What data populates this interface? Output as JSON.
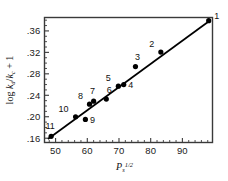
{
  "chart_data": {
    "type": "scatter",
    "title": "",
    "subtitle": "",
    "xlabel": "P_s^{1/2}",
    "xlabel_base": "P",
    "xlabel_sub": "s",
    "xlabel_sup": "1/2",
    "ylabel": "log k_d/k_c + 1",
    "ylabel_parts": [
      "log ",
      "k",
      "d",
      "/",
      "k",
      "c",
      " + 1"
    ],
    "xlim": [
      46.5,
      99.5
    ],
    "ylim": [
      0.152,
      0.385
    ],
    "xticks": [
      50,
      60,
      70,
      80,
      90
    ],
    "xtick_labels": [
      "50",
      "60",
      "70",
      "80",
      "90"
    ],
    "xminor_step": 2,
    "yticks": [
      0.16,
      0.2,
      0.24,
      0.28,
      0.32,
      0.36
    ],
    "ytick_labels": [
      ".16",
      ".20",
      ".24",
      ".28",
      ".32",
      ".36"
    ],
    "yminor_step": 0.01,
    "grid": false,
    "legend": "none",
    "marker": "filled-circle",
    "marker_color": "#000000",
    "line_color": "#000000",
    "fit_line": {
      "x1": 47.6,
      "y1": 0.1585,
      "x2": 98.6,
      "y2": 0.379
    },
    "points": [
      {
        "label": "1",
        "x": 98.3,
        "y": 0.379,
        "label_dx": 8,
        "label_dy": -2
      },
      {
        "label": "2",
        "x": 83.2,
        "y": 0.3205,
        "label_dx": -9,
        "label_dy": -5
      },
      {
        "label": "3",
        "x": 75.2,
        "y": 0.2935,
        "label_dx": 2,
        "label_dy": -7
      },
      {
        "label": "4",
        "x": 71.5,
        "y": 0.26,
        "label_dx": 7,
        "label_dy": 3
      },
      {
        "label": "5",
        "x": 69.8,
        "y": 0.257,
        "label_dx": -10,
        "label_dy": -5
      },
      {
        "label": "6",
        "x": 66.0,
        "y": 0.233,
        "label_dx": 3,
        "label_dy": -6
      },
      {
        "label": "7",
        "x": 62.0,
        "y": 0.229,
        "label_dx": -1,
        "label_dy": -7
      },
      {
        "label": "8",
        "x": 60.7,
        "y": 0.2235,
        "label_dx": -9,
        "label_dy": -5
      },
      {
        "label": "9",
        "x": 59.4,
        "y": 0.195,
        "label_dx": 7,
        "label_dy": 4
      },
      {
        "label": "10",
        "x": 56.3,
        "y": 0.2,
        "label_dx": -12,
        "label_dy": -5
      },
      {
        "label": "11",
        "x": 48.6,
        "y": 0.1635,
        "label_dx": -1,
        "label_dy": -7
      }
    ]
  },
  "figure": {
    "background_color": "#ffffff",
    "axis_color": "#3a3a3a",
    "ink_color": "#000000"
  }
}
